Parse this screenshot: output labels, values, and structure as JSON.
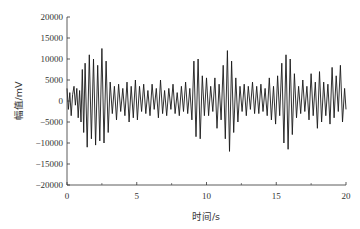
{
  "chart_data": {
    "type": "line",
    "title": "",
    "xlabel": "时间/s",
    "ylabel": "幅值/mV",
    "xlim": [
      0,
      20
    ],
    "ylim": [
      -20000,
      20000
    ],
    "x_ticks": [
      0,
      5,
      10,
      15,
      20
    ],
    "x_minor_ticks": [
      2.5,
      7.5,
      12.5,
      17.5
    ],
    "y_ticks": [
      -20000,
      -15000,
      -10000,
      -5000,
      0,
      5000,
      10000,
      15000,
      20000
    ],
    "grid": false,
    "legend": null,
    "line_color": "#1a1a1a",
    "series": [
      {
        "name": "signal",
        "x": [
          0,
          0.1,
          0.2,
          0.3,
          0.4,
          0.5,
          0.6,
          0.7,
          0.8,
          0.9,
          1.0,
          1.1,
          1.2,
          1.3,
          1.45,
          1.6,
          1.75,
          1.9,
          2.05,
          2.2,
          2.35,
          2.5,
          2.65,
          2.8,
          2.95,
          3.1,
          3.25,
          3.4,
          3.55,
          3.7,
          3.85,
          4.0,
          4.15,
          4.3,
          4.45,
          4.6,
          4.75,
          4.9,
          5.05,
          5.2,
          5.35,
          5.5,
          5.65,
          5.8,
          5.95,
          6.1,
          6.25,
          6.4,
          6.55,
          6.7,
          6.85,
          7.0,
          7.15,
          7.3,
          7.45,
          7.6,
          7.75,
          7.9,
          8.05,
          8.2,
          8.35,
          8.5,
          8.65,
          8.8,
          8.95,
          9.1,
          9.25,
          9.4,
          9.55,
          9.7,
          9.85,
          10.0,
          10.15,
          10.3,
          10.45,
          10.6,
          10.75,
          10.9,
          11.05,
          11.2,
          11.35,
          11.5,
          11.65,
          11.8,
          11.95,
          12.1,
          12.25,
          12.4,
          12.55,
          12.7,
          12.85,
          13.0,
          13.15,
          13.3,
          13.45,
          13.6,
          13.75,
          13.9,
          14.05,
          14.2,
          14.35,
          14.5,
          14.65,
          14.8,
          14.95,
          15.1,
          15.25,
          15.4,
          15.55,
          15.7,
          15.85,
          16.0,
          16.15,
          16.3,
          16.45,
          16.6,
          16.75,
          16.9,
          17.05,
          17.2,
          17.35,
          17.5,
          17.65,
          17.8,
          17.95,
          18.1,
          18.25,
          18.4,
          18.55,
          18.7,
          18.85,
          19.0,
          19.15,
          19.3,
          19.45,
          19.6,
          19.75,
          19.9,
          20.0
        ],
        "values": [
          3000,
          -2000,
          2000,
          -3500,
          1500,
          3500,
          -1000,
          3000,
          -4000,
          2500,
          -5000,
          7500,
          -7500,
          9000,
          -11000,
          11000,
          -9000,
          10000,
          -10500,
          8500,
          -9500,
          12500,
          -10000,
          9500,
          -7500,
          4500,
          -3000,
          3500,
          -4500,
          4000,
          -2500,
          3000,
          -3500,
          4500,
          -5000,
          3500,
          -4000,
          5000,
          -4500,
          3500,
          -2500,
          4000,
          -3000,
          2500,
          -3500,
          4000,
          -2000,
          3000,
          -4000,
          5000,
          -3000,
          2500,
          -3500,
          3000,
          -2000,
          4000,
          -3000,
          2000,
          -3500,
          3500,
          -2500,
          4500,
          -3000,
          3000,
          -4500,
          9500,
          -8500,
          10000,
          -9000,
          6000,
          -3500,
          5500,
          -3500,
          3500,
          -2500,
          5500,
          -6500,
          4000,
          -4500,
          8500,
          -9000,
          12000,
          -12000,
          9500,
          -7500,
          5500,
          -5000,
          3500,
          -2500,
          4000,
          -3500,
          3500,
          -2000,
          4500,
          -3000,
          3500,
          -3000,
          4000,
          -2500,
          3000,
          -3500,
          5500,
          -4500,
          3500,
          -5500,
          6000,
          -3500,
          9000,
          -10000,
          11000,
          -11500,
          10000,
          -8000,
          6500,
          -4000,
          3500,
          -3000,
          5000,
          -2500,
          3500,
          -4500,
          6500,
          -3500,
          4500,
          -6500,
          7000,
          -5000,
          4500,
          -3500,
          4000,
          -5500,
          8000,
          -4000,
          6000,
          -2500,
          8500,
          -5000,
          3000,
          -2000
        ]
      }
    ]
  }
}
